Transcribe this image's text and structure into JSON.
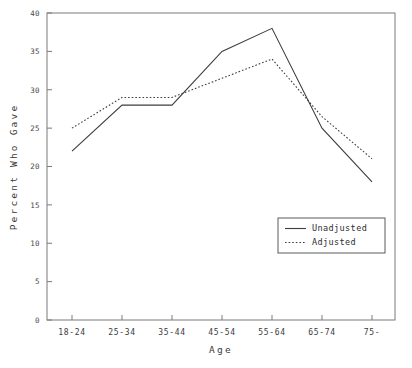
{
  "chart_data": {
    "type": "line",
    "title": "",
    "xlabel": "Age",
    "ylabel": "Percent Who Gave",
    "categories": [
      "18-24",
      "25-34",
      "35-44",
      "45-54",
      "55-64",
      "65-74",
      "75-"
    ],
    "ylim": [
      0,
      40
    ],
    "yticks": [
      0,
      5,
      10,
      15,
      20,
      25,
      30,
      35,
      40
    ],
    "yticklabels": [
      "0",
      "5",
      "10",
      "15",
      "20",
      "25",
      "30",
      "35",
      "40"
    ],
    "grid": false,
    "legend_position": "lower right",
    "series": [
      {
        "name": "Unadjusted",
        "style": "solid",
        "color": "#3d3d3d",
        "values": [
          22,
          28,
          28,
          35,
          38,
          25,
          18
        ]
      },
      {
        "name": "Adjusted",
        "style": "dotted",
        "color": "#3d3d3d",
        "values": [
          25,
          29,
          29,
          31.5,
          34,
          26.5,
          21
        ]
      }
    ]
  },
  "legend": {
    "items": [
      {
        "label": "Unadjusted",
        "style": "solid"
      },
      {
        "label": "Adjusted",
        "style": "dotted"
      }
    ]
  },
  "colors": {
    "axis": "#7a7a7a",
    "ink": "#3d3d3d",
    "text": "#3a3a3a",
    "background": "#ffffff"
  }
}
